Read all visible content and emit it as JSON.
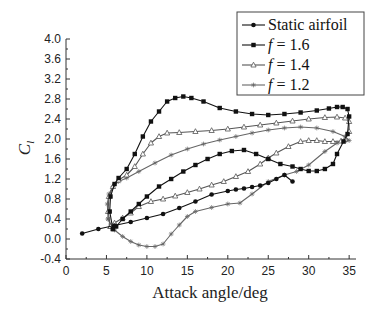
{
  "chart_data": {
    "type": "line",
    "title": "",
    "xlabel": "Attack angle/deg",
    "ylabel": "C_l",
    "ylabel_main": "C",
    "ylabel_sub": "l",
    "xlim": [
      0,
      36
    ],
    "ylim": [
      -0.4,
      4.0
    ],
    "xticks": [
      0,
      5,
      10,
      15,
      20,
      25,
      30,
      35
    ],
    "yticks": [
      -0.4,
      0.0,
      0.4,
      0.8,
      1.2,
      1.6,
      2.0,
      2.4,
      2.8,
      3.2,
      3.6,
      4.0
    ],
    "ytick_labels": [
      "-0.4",
      "0.0",
      "0.4",
      "0.8",
      "1.2",
      "1.6",
      "2.0",
      "2.4",
      "2.8",
      "3.2",
      "3.6",
      "4.0"
    ],
    "grid": false,
    "legend_position": "upper right",
    "series": [
      {
        "name": "Static airfoil",
        "label_prefix": "",
        "label_text": "Static airfoil",
        "marker": "filled-circle",
        "color": "#111111",
        "x": [
          2,
          4,
          6,
          8,
          10,
          12,
          14,
          16,
          18,
          20,
          21,
          22,
          23,
          24,
          25,
          26,
          27,
          28
        ],
        "y": [
          0.11,
          0.2,
          0.27,
          0.34,
          0.42,
          0.5,
          0.62,
          0.75,
          0.89,
          0.96,
          0.99,
          1.01,
          1.04,
          1.07,
          1.12,
          1.2,
          1.28,
          1.15
        ]
      },
      {
        "name": "f = 1.6",
        "label_prefix": "f",
        "label_text": " = 1.6",
        "marker": "filled-square",
        "color": "#111111",
        "x": [
          5.8,
          5.4,
          5.5,
          6.0,
          6.5,
          7.5,
          8.5,
          9.5,
          10.5,
          11.5,
          12.5,
          13.5,
          14.5,
          15.5,
          17,
          19,
          21,
          23,
          25,
          27,
          29,
          31,
          32.5,
          33.5,
          34.2,
          34.8,
          35,
          34.8,
          34.3,
          33.5,
          33,
          32,
          31,
          30,
          29,
          28,
          26.5,
          25,
          23.5,
          22,
          20.5,
          19,
          17.5,
          16,
          14.5,
          13,
          11.5,
          10,
          9,
          8,
          7,
          6.2,
          5.8
        ],
        "y": [
          0.2,
          0.55,
          0.85,
          1.1,
          1.22,
          1.4,
          1.7,
          2.05,
          2.35,
          2.55,
          2.75,
          2.82,
          2.85,
          2.82,
          2.75,
          2.62,
          2.55,
          2.5,
          2.48,
          2.5,
          2.53,
          2.57,
          2.61,
          2.64,
          2.64,
          2.6,
          2.45,
          2.1,
          1.95,
          1.7,
          1.5,
          1.4,
          1.36,
          1.36,
          1.4,
          1.45,
          1.5,
          1.6,
          1.7,
          1.78,
          1.76,
          1.7,
          1.6,
          1.48,
          1.35,
          1.2,
          1.05,
          0.85,
          0.7,
          0.55,
          0.4,
          0.25,
          0.2
        ]
      },
      {
        "name": "f = 1.4",
        "label_prefix": "f",
        "label_text": " = 1.4",
        "marker": "open-triangle",
        "color": "#555555",
        "x": [
          5.5,
          5.2,
          5.3,
          5.8,
          6.5,
          7.5,
          8.5,
          9.5,
          10.5,
          11.5,
          12.5,
          14,
          16,
          18,
          20,
          22,
          24,
          26,
          28,
          30,
          32,
          33.5,
          34.5,
          35,
          35,
          34.5,
          34,
          33,
          32,
          31,
          30,
          29,
          27.5,
          26,
          25,
          24,
          22.5,
          21,
          19.5,
          18,
          16.5,
          15,
          13.5,
          12,
          10.5,
          9,
          8,
          7,
          6,
          5.5
        ],
        "y": [
          0.25,
          0.55,
          0.85,
          1.05,
          1.18,
          1.28,
          1.45,
          1.7,
          1.92,
          2.05,
          2.12,
          2.13,
          2.15,
          2.17,
          2.2,
          2.24,
          2.28,
          2.32,
          2.36,
          2.4,
          2.43,
          2.44,
          2.42,
          2.35,
          2.15,
          2.0,
          1.96,
          1.95,
          1.95,
          1.97,
          1.97,
          1.95,
          1.85,
          1.72,
          1.62,
          1.5,
          1.35,
          1.25,
          1.15,
          1.08,
          1.0,
          0.93,
          0.86,
          0.8,
          0.75,
          0.65,
          0.52,
          0.42,
          0.32,
          0.25
        ]
      },
      {
        "name": "f = 1.2",
        "label_prefix": "f",
        "label_text": " = 1.2",
        "marker": "star",
        "color": "#666666",
        "x": [
          5.2,
          5.1,
          5.3,
          5.8,
          6.5,
          7.5,
          9,
          11,
          13,
          15,
          17,
          19,
          21,
          23,
          25,
          27,
          29,
          31,
          33,
          34.5,
          35,
          34.5,
          33.5,
          32,
          30,
          28.5,
          27,
          25,
          23,
          21.5,
          20,
          18,
          16,
          15,
          14,
          13,
          12,
          11,
          10,
          9,
          8,
          7,
          6,
          5.5,
          5.2
        ],
        "y": [
          0.4,
          0.7,
          0.9,
          1.05,
          1.15,
          1.22,
          1.35,
          1.52,
          1.68,
          1.8,
          1.9,
          1.98,
          2.05,
          2.12,
          2.18,
          2.22,
          2.24,
          2.22,
          2.15,
          2.05,
          1.97,
          1.95,
          1.92,
          1.75,
          1.48,
          1.35,
          1.28,
          1.15,
          0.9,
          0.72,
          0.7,
          0.63,
          0.55,
          0.45,
          0.28,
          0.1,
          -0.1,
          -0.15,
          -0.15,
          -0.12,
          -0.05,
          0.05,
          0.18,
          0.28,
          0.4
        ]
      }
    ]
  }
}
